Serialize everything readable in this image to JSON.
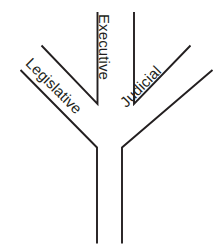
{
  "diagram": {
    "background_color": "#ffffff",
    "stroke_color": "#231f20",
    "branches": [
      {
        "id": "legislative",
        "label": "Legislative",
        "position": "left",
        "text_rotation_degrees": 45
      },
      {
        "id": "executive",
        "label": "Executive",
        "position": "center",
        "text_rotation_degrees": 90
      },
      {
        "id": "judicial",
        "label": "Judicial",
        "position": "right",
        "text_rotation_degrees": -45
      }
    ],
    "trunk": {
      "id": "trunk",
      "label": ""
    }
  }
}
